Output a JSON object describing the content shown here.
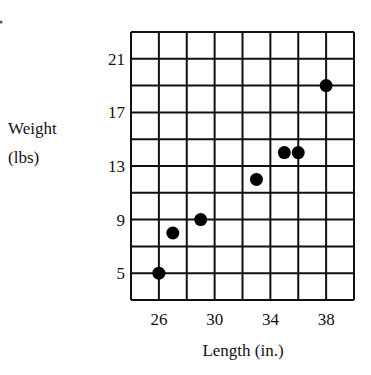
{
  "chart_data": {
    "type": "scatter",
    "title": "",
    "xlabel": "Length (in.)",
    "ylabel": "Weight (lbs)",
    "ylabel_lines": [
      "Weight",
      "(lbs)"
    ],
    "xlim": [
      24,
      40
    ],
    "ylim": [
      3,
      23
    ],
    "grid": true,
    "x_grid_step": 2,
    "y_grid_step": 2,
    "x_ticks": [
      26,
      30,
      34,
      38
    ],
    "y_ticks": [
      5,
      9,
      13,
      17,
      21
    ],
    "points": [
      {
        "x": 26,
        "y": 5
      },
      {
        "x": 27,
        "y": 8
      },
      {
        "x": 29,
        "y": 9
      },
      {
        "x": 33,
        "y": 12
      },
      {
        "x": 35,
        "y": 14
      },
      {
        "x": 36,
        "y": 14
      },
      {
        "x": 38,
        "y": 19
      }
    ],
    "x": [
      26,
      27,
      29,
      33,
      35,
      36,
      38
    ],
    "y": [
      5,
      8,
      9,
      12,
      14,
      14,
      19
    ],
    "marker_color": "#000000",
    "grid_color": "#111111"
  }
}
